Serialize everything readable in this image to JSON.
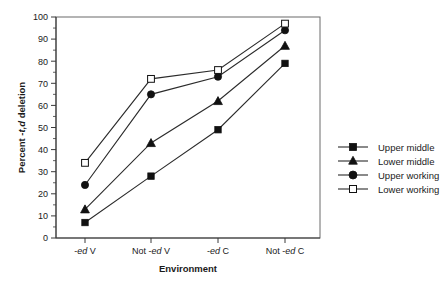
{
  "chart_data": {
    "type": "line",
    "title": "",
    "subtitle": "",
    "xlabel": "Environment",
    "ylabel": "Percent -t,d deletion",
    "categories": [
      "-ed V",
      "Not -ed V",
      "-ed C",
      "Not -ed C"
    ],
    "category_parts": [
      {
        "pre": "-",
        "ital": "ed",
        "post": " V"
      },
      {
        "pre": "Not -",
        "ital": "ed",
        "post": " V"
      },
      {
        "pre": "-",
        "ital": "ed",
        "post": " C"
      },
      {
        "pre": "Not -",
        "ital": "ed",
        "post": " C"
      }
    ],
    "ylim": [
      0,
      100
    ],
    "ytick_labels": [
      "0",
      "10",
      "20",
      "30",
      "40",
      "50",
      "60",
      "70",
      "80",
      "90",
      "100"
    ],
    "ytick_values": [
      0,
      10,
      20,
      30,
      40,
      50,
      60,
      70,
      80,
      90,
      100
    ],
    "grid": false,
    "legend_position": "right",
    "series": [
      {
        "name": "Upper middle",
        "marker": "filled-square",
        "values": [
          7,
          28,
          49,
          79
        ]
      },
      {
        "name": "Lower middle",
        "marker": "filled-triangle",
        "values": [
          13,
          43,
          62,
          87
        ]
      },
      {
        "name": "Upper working",
        "marker": "filled-circle",
        "values": [
          24,
          65,
          73,
          94
        ]
      },
      {
        "name": "Lower working",
        "marker": "open-square",
        "values": [
          34,
          72,
          76,
          97
        ]
      }
    ]
  },
  "ylabel_parts": {
    "pre": "Percent -",
    "ital": "t,d",
    "post": " deletion"
  },
  "colors": {
    "line": "#2b2b2b",
    "marker_fill": "#111111",
    "marker_open": "#ffffff",
    "axis": "#3a3a3a",
    "frame": "#6a6a6a",
    "text": "#1a1a1a",
    "background": "#ffffff"
  }
}
